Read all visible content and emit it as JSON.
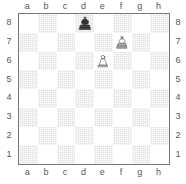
{
  "diagram": {
    "kind": "chess-board-diagram",
    "orientation": "white-bottom",
    "files": [
      "a",
      "b",
      "c",
      "d",
      "e",
      "f",
      "g",
      "h"
    ],
    "ranks": [
      "8",
      "7",
      "6",
      "5",
      "4",
      "3",
      "2",
      "1"
    ],
    "colors": {
      "light_square": "#ffffff",
      "dark_square": "#e2e2e2",
      "border": "#777777",
      "label_text": "#555555",
      "white_piece_fill": "#ffffff",
      "white_piece_stroke": "#333333",
      "black_piece_fill": "#333333",
      "black_piece_stroke": "#222222",
      "page_background": "#ffffff"
    },
    "pieces": [
      {
        "square": "d8",
        "file": "d",
        "rank": "8",
        "color": "black",
        "type": "king",
        "icon": "black-king-icon",
        "glyph": "♚"
      },
      {
        "square": "f7",
        "file": "f",
        "rank": "7",
        "color": "white",
        "type": "king",
        "icon": "white-king-icon",
        "glyph": "♔"
      },
      {
        "square": "e6",
        "file": "e",
        "rank": "6",
        "color": "white",
        "type": "pawn",
        "icon": "white-pawn-icon",
        "glyph": "♙"
      }
    ],
    "squares": [
      {
        "id": "a8",
        "shade": "light",
        "piece": null
      },
      {
        "id": "b8",
        "shade": "dark",
        "piece": null
      },
      {
        "id": "c8",
        "shade": "light",
        "piece": null
      },
      {
        "id": "d8",
        "shade": "dark",
        "piece": "black-king"
      },
      {
        "id": "e8",
        "shade": "light",
        "piece": null
      },
      {
        "id": "f8",
        "shade": "dark",
        "piece": null
      },
      {
        "id": "g8",
        "shade": "light",
        "piece": null
      },
      {
        "id": "h8",
        "shade": "dark",
        "piece": null
      },
      {
        "id": "a7",
        "shade": "dark",
        "piece": null
      },
      {
        "id": "b7",
        "shade": "light",
        "piece": null
      },
      {
        "id": "c7",
        "shade": "dark",
        "piece": null
      },
      {
        "id": "d7",
        "shade": "light",
        "piece": null
      },
      {
        "id": "e7",
        "shade": "dark",
        "piece": null
      },
      {
        "id": "f7",
        "shade": "light",
        "piece": "white-king"
      },
      {
        "id": "g7",
        "shade": "dark",
        "piece": null
      },
      {
        "id": "h7",
        "shade": "light",
        "piece": null
      },
      {
        "id": "a6",
        "shade": "light",
        "piece": null
      },
      {
        "id": "b6",
        "shade": "dark",
        "piece": null
      },
      {
        "id": "c6",
        "shade": "light",
        "piece": null
      },
      {
        "id": "d6",
        "shade": "dark",
        "piece": null
      },
      {
        "id": "e6",
        "shade": "light",
        "piece": "white-pawn"
      },
      {
        "id": "f6",
        "shade": "dark",
        "piece": null
      },
      {
        "id": "g6",
        "shade": "light",
        "piece": null
      },
      {
        "id": "h6",
        "shade": "dark",
        "piece": null
      },
      {
        "id": "a5",
        "shade": "dark",
        "piece": null
      },
      {
        "id": "b5",
        "shade": "light",
        "piece": null
      },
      {
        "id": "c5",
        "shade": "dark",
        "piece": null
      },
      {
        "id": "d5",
        "shade": "light",
        "piece": null
      },
      {
        "id": "e5",
        "shade": "dark",
        "piece": null
      },
      {
        "id": "f5",
        "shade": "light",
        "piece": null
      },
      {
        "id": "g5",
        "shade": "dark",
        "piece": null
      },
      {
        "id": "h5",
        "shade": "light",
        "piece": null
      },
      {
        "id": "a4",
        "shade": "light",
        "piece": null
      },
      {
        "id": "b4",
        "shade": "dark",
        "piece": null
      },
      {
        "id": "c4",
        "shade": "light",
        "piece": null
      },
      {
        "id": "d4",
        "shade": "dark",
        "piece": null
      },
      {
        "id": "e4",
        "shade": "light",
        "piece": null
      },
      {
        "id": "f4",
        "shade": "dark",
        "piece": null
      },
      {
        "id": "g4",
        "shade": "light",
        "piece": null
      },
      {
        "id": "h4",
        "shade": "dark",
        "piece": null
      },
      {
        "id": "a3",
        "shade": "dark",
        "piece": null
      },
      {
        "id": "b3",
        "shade": "light",
        "piece": null
      },
      {
        "id": "c3",
        "shade": "dark",
        "piece": null
      },
      {
        "id": "d3",
        "shade": "light",
        "piece": null
      },
      {
        "id": "e3",
        "shade": "dark",
        "piece": null
      },
      {
        "id": "f3",
        "shade": "light",
        "piece": null
      },
      {
        "id": "g3",
        "shade": "dark",
        "piece": null
      },
      {
        "id": "h3",
        "shade": "light",
        "piece": null
      },
      {
        "id": "a2",
        "shade": "light",
        "piece": null
      },
      {
        "id": "b2",
        "shade": "dark",
        "piece": null
      },
      {
        "id": "c2",
        "shade": "light",
        "piece": null
      },
      {
        "id": "d2",
        "shade": "dark",
        "piece": null
      },
      {
        "id": "e2",
        "shade": "light",
        "piece": null
      },
      {
        "id": "f2",
        "shade": "dark",
        "piece": null
      },
      {
        "id": "g2",
        "shade": "light",
        "piece": null
      },
      {
        "id": "h2",
        "shade": "dark",
        "piece": null
      },
      {
        "id": "a1",
        "shade": "dark",
        "piece": null
      },
      {
        "id": "b1",
        "shade": "light",
        "piece": null
      },
      {
        "id": "c1",
        "shade": "dark",
        "piece": null
      },
      {
        "id": "d1",
        "shade": "light",
        "piece": null
      },
      {
        "id": "e1",
        "shade": "dark",
        "piece": null
      },
      {
        "id": "f1",
        "shade": "light",
        "piece": null
      },
      {
        "id": "g1",
        "shade": "dark",
        "piece": null
      },
      {
        "id": "h1",
        "shade": "light",
        "piece": null
      }
    ]
  }
}
